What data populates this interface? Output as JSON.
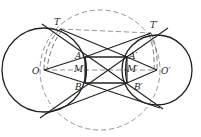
{
  "diagram": {
    "type": "geometry",
    "labels": {
      "T": "T",
      "T_prime": "T′",
      "O": "O",
      "O_prime": "O′",
      "A": "A",
      "A_prime": "A′",
      "M": "M",
      "M_prime": "M′",
      "B": "B",
      "B_prime": "B′"
    },
    "points": {
      "O": [
        44,
        70
      ],
      "O_prime": [
        157,
        70
      ],
      "T": [
        60,
        29
      ],
      "T_prime": [
        151,
        33
      ],
      "A": [
        85,
        57
      ],
      "B": [
        85,
        83
      ],
      "M": [
        85,
        70
      ],
      "A_prime": [
        127,
        57
      ],
      "B_prime": [
        127,
        83
      ],
      "M_prime": [
        127,
        70
      ]
    },
    "circles": {
      "left_circle": {
        "center": "O",
        "radius": 42,
        "style": "solid"
      },
      "right_circle": {
        "center": "O_prime",
        "radius": 35,
        "style": "solid"
      },
      "large_dashed_circle": {
        "center": [
          100,
          70
        ],
        "radius": 60,
        "style": "dashed"
      }
    },
    "colors": {
      "stroke": "#222222",
      "dashed": "#888888",
      "background": "#ffffff"
    }
  }
}
